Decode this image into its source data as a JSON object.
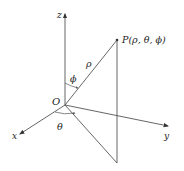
{
  "diagram": {
    "labels": {
      "z_axis": "z",
      "x_axis": "x",
      "y_axis": "y",
      "origin": "O",
      "point": "P(ρ, θ, ϕ)",
      "rho": "ρ",
      "phi": "ϕ",
      "theta": "θ"
    },
    "colors": {
      "line": "#555555",
      "text": "#222222",
      "background": "#ffffff"
    }
  }
}
